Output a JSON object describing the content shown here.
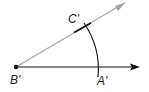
{
  "diagram": {
    "type": "geometric-construction",
    "labels": {
      "vertex": "B'",
      "point_on_horizontal_ray": "A'",
      "point_on_gray_ray": "C'"
    },
    "colors": {
      "horizontal_ray": "#111111",
      "gray_ray": "#a6a6a6",
      "arc": "#1a1a1a",
      "tick_mark": "#111111",
      "vertex_point": "#111111",
      "background": "#ffffff"
    },
    "geometry": {
      "vertex": [
        16,
        67
      ],
      "horizontal_ray_end": [
        139,
        67
      ],
      "gray_ray_end": [
        125,
        3
      ],
      "arc_radius": 82,
      "arc_crosses_horizontal_at": [
        98,
        67
      ],
      "arc_crosses_gray_ray_at": [
        86,
        26
      ]
    }
  }
}
